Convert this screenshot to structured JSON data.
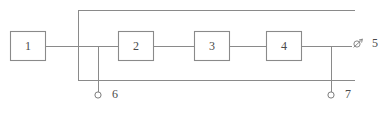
{
  "diagram": {
    "type": "block-diagram",
    "background_color": "#ffffff",
    "line_color": "#8a8a8a",
    "text_color": "#4a4a4a",
    "blocks": [
      {
        "id": "block-1",
        "label": "1",
        "x": 10,
        "y": 31,
        "width": 35,
        "height": 29
      },
      {
        "id": "block-2",
        "label": "2",
        "x": 118,
        "y": 31,
        "width": 35,
        "height": 29
      },
      {
        "id": "block-3",
        "label": "3",
        "x": 194,
        "y": 31,
        "width": 35,
        "height": 29
      },
      {
        "id": "block-4",
        "label": "4",
        "x": 266,
        "y": 31,
        "width": 35,
        "height": 29
      }
    ],
    "terminals": [
      {
        "id": "terminal-5",
        "label": "5",
        "glyph": "port-arrow-icon",
        "x": 356,
        "y": 43,
        "label_x": 375,
        "label_y": 43
      },
      {
        "id": "terminal-6",
        "label": "6",
        "glyph": "open-circle-icon",
        "x": 98,
        "y": 95,
        "label_x": 115,
        "label_y": 95
      },
      {
        "id": "terminal-7",
        "label": "7",
        "glyph": "open-circle-icon",
        "x": 331,
        "y": 95,
        "label_x": 348,
        "label_y": 95
      }
    ],
    "wires": {
      "main_line_y": 46,
      "top_line_y": 10,
      "bottom_line_y": 80,
      "left_bus_x": 78,
      "terminal6_bus_x": 98,
      "terminal7_bus_x": 331,
      "right_end_x": 355,
      "main_line_start_x": 45,
      "main_line_end_x": 352
    }
  }
}
